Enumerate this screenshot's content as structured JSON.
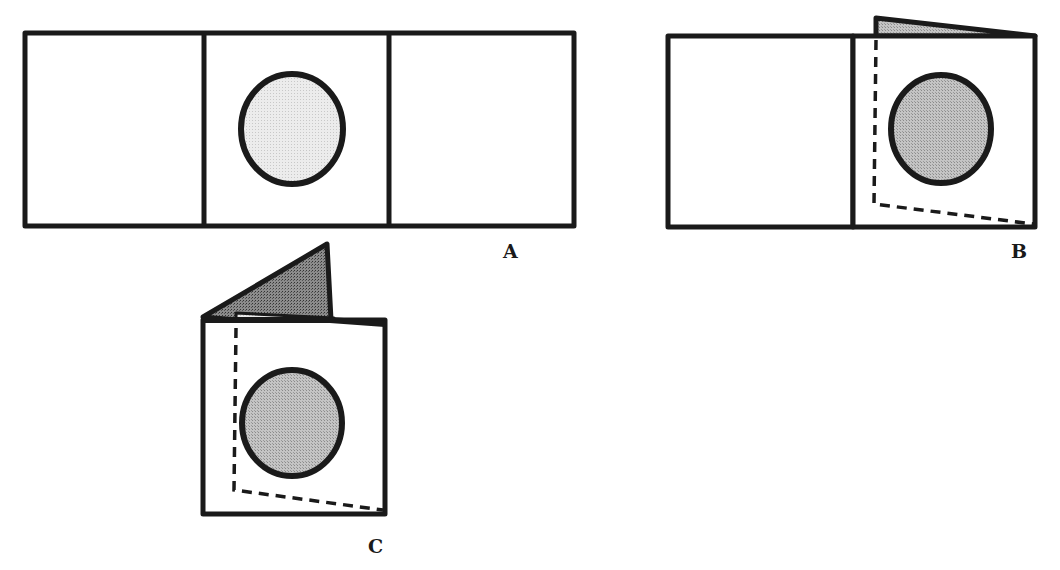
{
  "figure": {
    "colors": {
      "outline": "#1a1a1a",
      "circle_fill_light": "#e6e6e6",
      "circle_fill_mid": "#b8b8b8",
      "flap_fill_light": "#bdbdbd",
      "flap_fill_dark": "#7a7a7a",
      "paper": "#ffffff"
    },
    "panels": [
      {
        "id": "A",
        "label": "A",
        "state": "unfolded three-panel strip with circle in middle panel"
      },
      {
        "id": "B",
        "label": "B",
        "state": "right panel folded behind middle panel; left panel still flat"
      },
      {
        "id": "C",
        "label": "C",
        "state": "both side panels folded; flap visible above top edge"
      }
    ]
  }
}
